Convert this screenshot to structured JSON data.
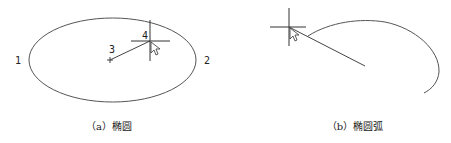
{
  "figure_a": {
    "caption": "（a）椭圆",
    "labels": {
      "p1": "1",
      "p2": "2",
      "p3": "3",
      "p4": "4"
    },
    "shape": "ellipse",
    "stroke_color": "#555555"
  },
  "figure_b": {
    "caption": "（b）椭圆弧",
    "shape": "elliptical-arc",
    "stroke_color": "#555555"
  }
}
